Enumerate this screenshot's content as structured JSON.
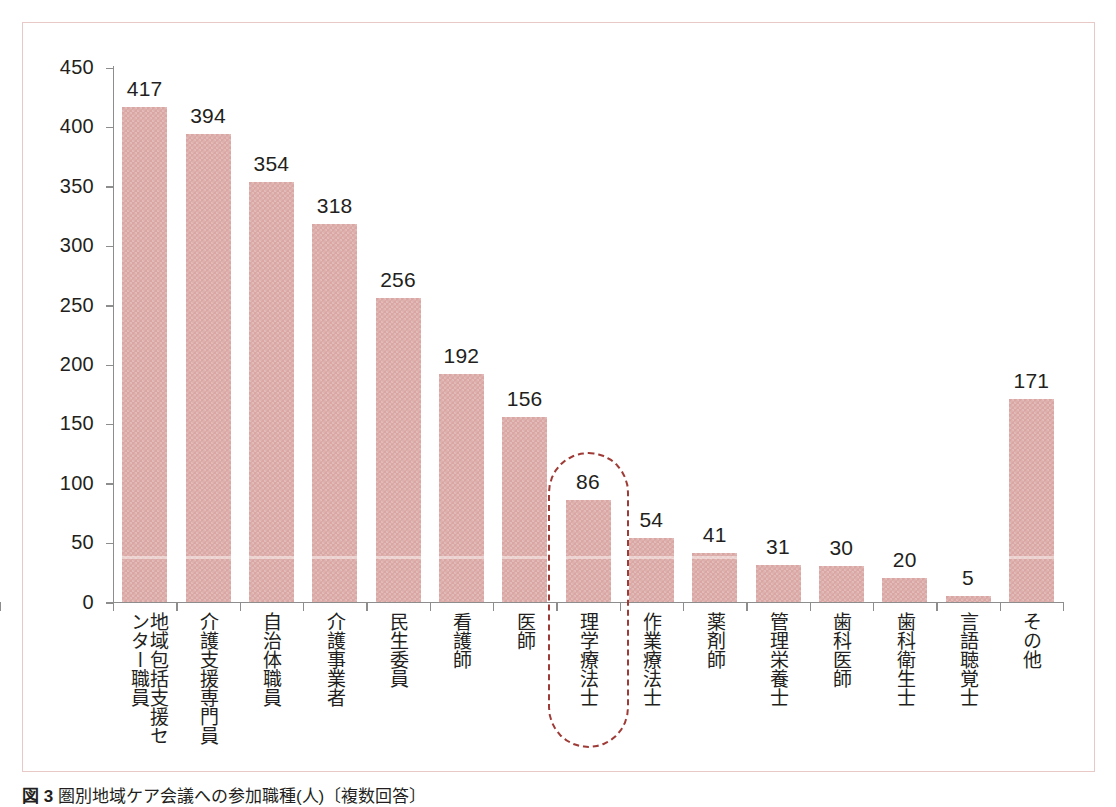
{
  "chart_data": {
    "type": "bar",
    "title": "",
    "xlabel": "",
    "ylabel": "",
    "ylim": [
      0,
      450
    ],
    "ytick_step": 50,
    "grid": false,
    "legend": null,
    "yticks": [
      "450",
      "400",
      "350",
      "300",
      "250",
      "200",
      "150",
      "100",
      "50",
      "0"
    ],
    "categories": [
      "地域包括支援センター職員",
      "介護支援専門員",
      "自治体職員",
      "介護事業者",
      "民生委員",
      "看護師",
      "医師",
      "理学療法士",
      "作業療法士",
      "薬剤師",
      "管理栄養士",
      "歯科医師",
      "歯科衛生士",
      "言語聴覚士",
      "その他"
    ],
    "values": [
      417,
      394,
      354,
      318,
      256,
      192,
      156,
      86,
      54,
      41,
      31,
      30,
      20,
      5,
      171
    ],
    "value_labels": [
      "417",
      "394",
      "354",
      "318",
      "256",
      "192",
      "156",
      "86",
      "54",
      "41",
      "31",
      "30",
      "20",
      "5",
      "171"
    ],
    "highlight": {
      "category": "理学療法士",
      "value_label": "86",
      "style": "dashed-capsule"
    },
    "colors": {
      "bar": "#d9a6a3",
      "axis": "#8d8d8d",
      "text": "#231f20",
      "frame": "#e8c9c6",
      "highlight": "#9e3b36",
      "background": "#ffffff"
    }
  },
  "caption": {
    "label": "図 3",
    "text": "圏別地域ケア会議への参加職種(人)〔複数回答〕"
  }
}
